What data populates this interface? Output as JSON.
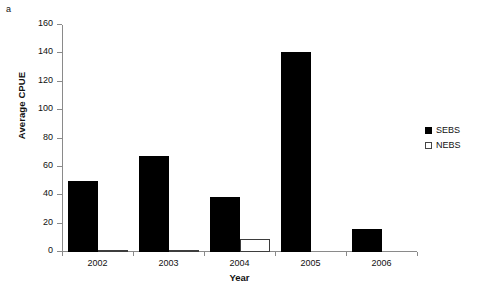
{
  "panel": {
    "label": "a"
  },
  "chart_data": {
    "type": "bar",
    "title": "",
    "xlabel": "Year",
    "ylabel": "Average CPUE",
    "categories": [
      "2002",
      "2003",
      "2004",
      "2005",
      "2006"
    ],
    "series": [
      {
        "name": "SEBS",
        "color": "#000000",
        "style": "filled",
        "values": [
          50,
          68,
          39,
          141,
          16
        ]
      },
      {
        "name": "NEBS",
        "color": "#ffffff",
        "style": "open",
        "values": [
          1,
          1,
          9,
          0,
          0
        ]
      }
    ],
    "ylim": [
      0,
      160
    ],
    "ytick_step": 20,
    "yticks": [
      0,
      20,
      40,
      60,
      80,
      100,
      120,
      140,
      160
    ],
    "ytick_labels": [
      "0",
      "20",
      "40",
      "60",
      "80",
      "100",
      "120",
      "140",
      "160"
    ],
    "grid": false,
    "legend_position": "right"
  },
  "legend": {
    "entries": [
      {
        "label": "SEBS",
        "swatch": "filled-square"
      },
      {
        "label": "NEBS",
        "swatch": "open-square"
      }
    ]
  }
}
